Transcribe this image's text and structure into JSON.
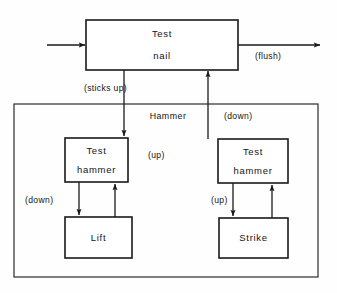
{
  "diagram": {
    "colors": {
      "background": "#fefefe",
      "stroke": "#1a1a1a",
      "container_stroke": "#2b2b2b",
      "box_fill": "#ffffff",
      "text": "#141414"
    },
    "boxes": [
      {
        "id": "test-nail",
        "line1": "Test",
        "line2": "nail"
      },
      {
        "id": "test-hammer-left",
        "line1": "Test",
        "line2": "hammer"
      },
      {
        "id": "test-hammer-right",
        "line1": "Test",
        "line2": "hammer"
      },
      {
        "id": "lift",
        "line1": "Lift",
        "line2": ""
      },
      {
        "id": "strike",
        "line1": "Strike",
        "line2": ""
      }
    ],
    "container": {
      "id": "hammer-container",
      "label": "Hammer"
    },
    "edge_labels": {
      "sticks_up": "(sticks  up)",
      "flush": "(flush)",
      "down_right": "(down)",
      "up_middle": "(up)",
      "down_left": "(down)",
      "up_right": "(up)"
    }
  }
}
